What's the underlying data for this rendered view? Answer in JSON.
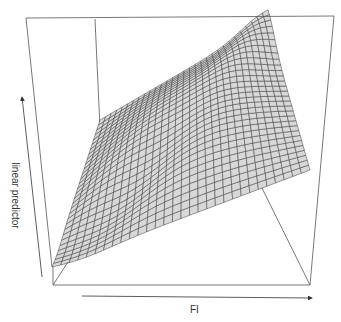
{
  "chart_data": {
    "type": "surface",
    "title": "",
    "xlabel": "FI",
    "ylabel": "",
    "zlabel": "linear predictor",
    "ticks": "none (arrow-only axes)",
    "grid_resolution": [
      30,
      30
    ],
    "colors": {
      "surface_fill": "#d8d8d8",
      "mesh_line": "#3a3a3a",
      "box": "#555555",
      "axis_arrow": "#333333"
    },
    "box": {
      "outer_top_left": [
        26,
        18
      ],
      "outer_top_right": [
        334,
        16
      ],
      "front_bottom_left": [
        53,
        285
      ],
      "front_bottom_right": [
        310,
        285
      ],
      "back_vertical_x": 95,
      "inner_corner": [
        259,
        182
      ],
      "inner_left": [
        205,
        182
      ]
    },
    "surface_outline": {
      "bottom_left": [
        52,
        267
      ],
      "top_far_corner": [
        268,
        22
      ],
      "right_edge": [
        321,
        155
      ]
    }
  },
  "labels": {
    "y_axis": "linear predictor",
    "x_axis": "FI"
  }
}
